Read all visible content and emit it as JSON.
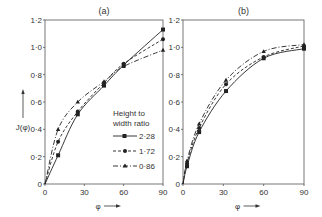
{
  "figure": {
    "ylabel": "J(φ)",
    "xlabel": "φ",
    "legend": {
      "title_line1": "Height to",
      "title_line2": "width ratio",
      "entries": [
        "2·28",
        "1·72",
        "0·86"
      ]
    }
  },
  "chart_data": [
    {
      "type": "line",
      "title": "(a)",
      "xlabel": "φ",
      "ylabel": "J(φ)",
      "xlim": [
        0,
        90
      ],
      "ylim": [
        0,
        1.2
      ],
      "xticks": [
        0,
        30,
        60,
        90
      ],
      "xtick_labels": [
        "0",
        "30",
        "60",
        "90"
      ],
      "yticks": [
        0,
        0.2,
        0.4,
        0.6,
        0.8,
        1.0,
        1.2
      ],
      "ytick_labels": [
        "0",
        "0·2",
        "0·4",
        "0·6",
        "0·8",
        "1·0",
        "1·2"
      ],
      "grid": false,
      "legend_position": "lower right",
      "series": [
        {
          "name": "2·28",
          "style": "solid",
          "marker": "square",
          "x": [
            0,
            10,
            25,
            45,
            60,
            90
          ],
          "y": [
            0,
            0.21,
            0.51,
            0.72,
            0.87,
            1.13
          ]
        },
        {
          "name": "1·72",
          "style": "dashed",
          "marker": "circle",
          "x": [
            0,
            10,
            25,
            45,
            60,
            90
          ],
          "y": [
            0,
            0.31,
            0.53,
            0.74,
            0.88,
            1.06
          ]
        },
        {
          "name": "0·86",
          "style": "dashdot",
          "marker": "triangle",
          "x": [
            0,
            10,
            25,
            45,
            60,
            90
          ],
          "y": [
            0,
            0.4,
            0.6,
            0.75,
            0.86,
            0.98
          ]
        }
      ]
    },
    {
      "type": "line",
      "title": "(b)",
      "xlabel": "φ",
      "ylabel": "",
      "xlim": [
        0,
        90
      ],
      "ylim": [
        0,
        1.2
      ],
      "xticks": [
        0,
        30,
        60,
        90
      ],
      "xtick_labels": [
        "0",
        "30",
        "60",
        "90"
      ],
      "yticks": [
        0,
        0.2,
        0.4,
        0.6,
        0.8,
        1.0,
        1.2
      ],
      "ytick_labels": [
        "0",
        "0·2",
        "0·4",
        "0·6",
        "0·8",
        "1·0",
        "1·2"
      ],
      "grid": false,
      "series": [
        {
          "name": "2·28",
          "style": "solid",
          "marker": "square",
          "x": [
            0,
            3,
            12,
            32,
            60,
            90
          ],
          "y": [
            0,
            0.13,
            0.38,
            0.68,
            0.92,
            0.99
          ]
        },
        {
          "name": "1·72",
          "style": "dashed",
          "marker": "circle",
          "x": [
            0,
            3,
            12,
            32,
            60,
            90
          ],
          "y": [
            0,
            0.15,
            0.41,
            0.73,
            0.93,
            1.01
          ]
        },
        {
          "name": "0·86",
          "style": "dashdot",
          "marker": "triangle",
          "x": [
            0,
            3,
            12,
            32,
            60,
            90
          ],
          "y": [
            0,
            0.17,
            0.44,
            0.76,
            0.97,
            1.02
          ]
        }
      ]
    }
  ]
}
